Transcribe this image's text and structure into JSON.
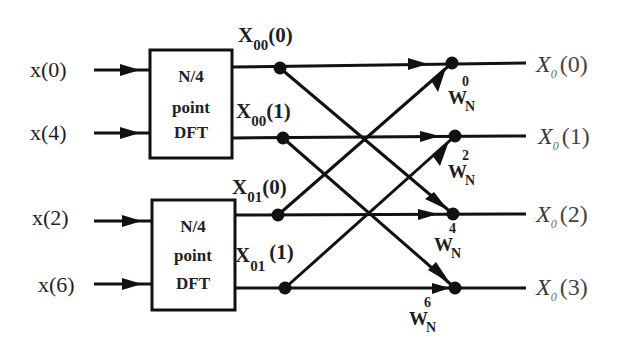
{
  "diagram": {
    "inputs": [
      {
        "label": "x(0)",
        "y": 70
      },
      {
        "label": "x(4)",
        "y": 133
      },
      {
        "label": "x(2)",
        "y": 218
      },
      {
        "label": "x(6)",
        "y": 285
      }
    ],
    "blocks": [
      {
        "line1": "N/4",
        "line2": "point",
        "line3": "DFT"
      },
      {
        "line1": "N/4",
        "line2": "point",
        "line3": "DFT"
      }
    ],
    "intermediate": [
      {
        "base": "X",
        "sub": "00",
        "arg": "(0)"
      },
      {
        "base": "X",
        "sub": "00",
        "arg": "(1)"
      },
      {
        "base": "X",
        "sub": "01",
        "arg": "(0)"
      },
      {
        "base": "X",
        "sub": "01",
        "arg": "(1)"
      }
    ],
    "twiddles": [
      {
        "base": "W",
        "sub": "N",
        "exp": "0"
      },
      {
        "base": "W",
        "sub": "N",
        "exp": "2"
      },
      {
        "base": "W",
        "sub": "N",
        "exp": "4"
      },
      {
        "base": "W",
        "sub": "N",
        "exp": "6"
      }
    ],
    "outputs": [
      {
        "base": "X",
        "sub": "0",
        "arg": "(0)"
      },
      {
        "base": "X",
        "sub": "0",
        "arg": "(1)"
      },
      {
        "base": "X",
        "sub": "0",
        "arg": "(2)"
      },
      {
        "base": "X",
        "sub": "0",
        "arg": "(3)"
      }
    ],
    "colors": {
      "stroke": "#111111",
      "background": "#ffffff"
    }
  }
}
